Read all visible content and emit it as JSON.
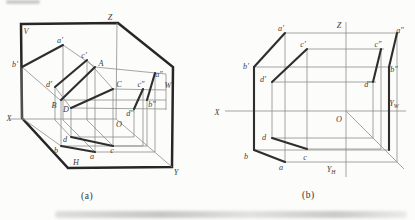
{
  "page": {
    "caption_a": "(a)",
    "caption_b": "(b)"
  },
  "colors": {
    "outline": "#262626",
    "heavy": "#2e2e2e",
    "thin": "#8e8e8e",
    "label": "#3d3d3d",
    "background": "#fcfcfa"
  },
  "diagram_a": {
    "outline": [
      [
        21,
        24
      ],
      [
        118,
        23
      ],
      [
        173,
        67
      ],
      [
        172,
        167
      ],
      [
        68,
        168
      ],
      [
        22,
        118
      ]
    ],
    "thin": [
      [
        117,
        23,
        116,
        119
      ],
      [
        10,
        119,
        116,
        119
      ],
      [
        116,
        119,
        172,
        167
      ],
      [
        63,
        45,
        95,
        67
      ],
      [
        22,
        67,
        60,
        100
      ],
      [
        87,
        60,
        113,
        89
      ],
      [
        55,
        87,
        71,
        108
      ],
      [
        95,
        67,
        95,
        152
      ],
      [
        61,
        100,
        61,
        146
      ],
      [
        113,
        89,
        113,
        146
      ],
      [
        71,
        108,
        71,
        137
      ],
      [
        95,
        67,
        166,
        74
      ],
      [
        61,
        100,
        166,
        100
      ],
      [
        113,
        89,
        166,
        90
      ],
      [
        71,
        108,
        166,
        109
      ],
      [
        63,
        45,
        63,
        120
      ],
      [
        63,
        120,
        95,
        152
      ],
      [
        22,
        67,
        22,
        118
      ],
      [
        22,
        118,
        61,
        146
      ],
      [
        87,
        60,
        87,
        120
      ],
      [
        87,
        120,
        113,
        146
      ],
      [
        55,
        87,
        55,
        120
      ],
      [
        55,
        120,
        71,
        137
      ],
      [
        155,
        73,
        155,
        152
      ],
      [
        95,
        152,
        155,
        152
      ],
      [
        147,
        100,
        147,
        146
      ],
      [
        61,
        146,
        147,
        146
      ],
      [
        143,
        89,
        143,
        146
      ],
      [
        113,
        146,
        143,
        146
      ],
      [
        134,
        109,
        134,
        137
      ],
      [
        71,
        137,
        134,
        137
      ],
      [
        166,
        74,
        166,
        110
      ]
    ],
    "thick": [
      [
        63,
        45,
        22,
        67
      ],
      [
        87,
        60,
        55,
        87
      ],
      [
        95,
        67,
        61,
        100
      ],
      [
        113,
        89,
        71,
        108
      ],
      [
        61,
        146,
        95,
        152
      ],
      [
        71,
        137,
        113,
        146
      ],
      [
        155,
        73,
        147,
        100
      ],
      [
        143,
        89,
        134,
        109
      ]
    ],
    "labels": [
      {
        "t": "V",
        "x": 26,
        "y": 34
      },
      {
        "t": "Z",
        "x": 110,
        "y": 20
      },
      {
        "t": "W",
        "x": 168,
        "y": 88
      },
      {
        "t": "X",
        "x": 9,
        "y": 121
      },
      {
        "t": "Y",
        "x": 176,
        "y": 175
      },
      {
        "t": "H",
        "x": 76,
        "y": 165
      },
      {
        "t": "O",
        "x": 119,
        "y": 127
      },
      {
        "t": "a′",
        "x": 60,
        "y": 43
      },
      {
        "t": "b′",
        "x": 15,
        "y": 67
      },
      {
        "t": "c′",
        "x": 84,
        "y": 58
      },
      {
        "t": "d′",
        "x": 49,
        "y": 87
      },
      {
        "t": "A",
        "x": 101,
        "y": 66
      },
      {
        "t": "B",
        "x": 54,
        "y": 108
      },
      {
        "t": "C",
        "x": 119,
        "y": 87
      },
      {
        "t": "D",
        "x": 66,
        "y": 112
      },
      {
        "t": "a″",
        "x": 159,
        "y": 77
      },
      {
        "t": "b″",
        "x": 152,
        "y": 107
      },
      {
        "t": "c″",
        "x": 141,
        "y": 87
      },
      {
        "t": "d″",
        "x": 130,
        "y": 116
      },
      {
        "t": "a",
        "x": 92,
        "y": 159
      },
      {
        "t": "b",
        "x": 56,
        "y": 153
      },
      {
        "t": "c",
        "x": 112,
        "y": 153
      },
      {
        "t": "d",
        "x": 65,
        "y": 142
      }
    ]
  },
  "diagram_b": {
    "outline": null,
    "thin": [
      [
        225,
        111,
        406,
        111
      ],
      [
        346,
        22,
        346,
        177
      ],
      [
        346,
        111,
        404,
        169
      ],
      [
        285,
        33,
        285,
        162
      ],
      [
        307,
        49,
        307,
        149
      ],
      [
        272,
        82,
        272,
        138
      ],
      [
        285,
        33,
        399,
        33
      ],
      [
        254,
        67,
        391,
        67
      ],
      [
        307,
        49,
        384,
        49
      ],
      [
        272,
        82,
        376,
        82
      ],
      [
        285,
        162,
        397,
        162
      ],
      [
        254,
        150,
        389,
        150
      ],
      [
        307,
        149,
        381,
        149
      ],
      [
        272,
        138,
        373,
        138
      ],
      [
        397,
        162,
        397,
        33
      ],
      [
        381,
        149,
        381,
        49
      ],
      [
        373,
        138,
        373,
        82
      ]
    ],
    "thick": [
      [
        285,
        33,
        254,
        67
      ],
      [
        307,
        49,
        272,
        82
      ],
      [
        254,
        67,
        254,
        150
      ],
      [
        254,
        150,
        285,
        162
      ],
      [
        272,
        138,
        307,
        149
      ],
      [
        397,
        33,
        389,
        67
      ],
      [
        381,
        49,
        373,
        82
      ],
      [
        389,
        67,
        389,
        150
      ]
    ],
    "labels": [
      {
        "t": "Z",
        "x": 339,
        "y": 28
      },
      {
        "t": "X",
        "x": 217,
        "y": 115
      },
      {
        "t": "O",
        "x": 339,
        "y": 122
      },
      {
        "t": "Y",
        "sub": "W",
        "x": 394,
        "y": 106
      },
      {
        "t": "Y",
        "sub": "H",
        "x": 331,
        "y": 172
      },
      {
        "t": "a′",
        "x": 281,
        "y": 31
      },
      {
        "t": "b′",
        "x": 246,
        "y": 69
      },
      {
        "t": "c′",
        "x": 303,
        "y": 47
      },
      {
        "t": "d′",
        "x": 263,
        "y": 82
      },
      {
        "t": "a″",
        "x": 400,
        "y": 33
      },
      {
        "t": "b″",
        "x": 394,
        "y": 72
      },
      {
        "t": "c″",
        "x": 378,
        "y": 47
      },
      {
        "t": "d″",
        "x": 368,
        "y": 87
      },
      {
        "t": "a",
        "x": 281,
        "y": 170
      },
      {
        "t": "b",
        "x": 246,
        "y": 159
      },
      {
        "t": "c",
        "x": 305,
        "y": 160
      },
      {
        "t": "d",
        "x": 264,
        "y": 140
      }
    ]
  },
  "captions": {
    "a": {
      "text": "(a)",
      "x": 81,
      "y": 191
    },
    "b": {
      "text": "(b)",
      "x": 302,
      "y": 190
    }
  }
}
